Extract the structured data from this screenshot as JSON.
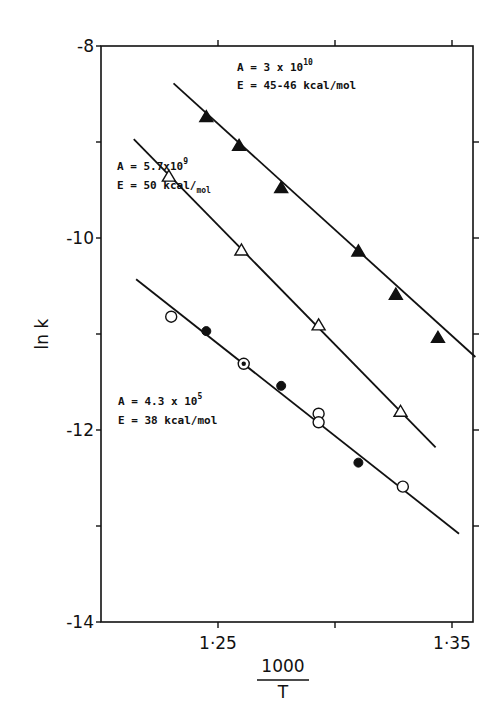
{
  "chart_data": {
    "type": "scatter",
    "title": "",
    "xlabel": "1000/T",
    "xlabel_numerator": "1000",
    "xlabel_denominator": "T",
    "ylabel": "ln k",
    "xlim": [
      1.2,
      1.359
    ],
    "ylim": [
      -14,
      -8
    ],
    "x_ticks": [
      1.25,
      1.3,
      1.35
    ],
    "x_tick_labels": [
      "1·25",
      "",
      "1·35"
    ],
    "y_ticks": [
      -8,
      -9,
      -10,
      -11,
      -12,
      -13,
      -14
    ],
    "y_tick_labels": [
      "-8",
      "",
      "-10",
      "",
      "-12",
      "",
      "-14"
    ],
    "grid": false,
    "legend": "none (inline annotations)",
    "series": [
      {
        "name": "filled triangles",
        "marker": "filled-triangle",
        "points": [
          [
            1.245,
            -8.74
          ],
          [
            1.259,
            -9.04
          ],
          [
            1.277,
            -9.48
          ],
          [
            1.31,
            -10.14
          ],
          [
            1.326,
            -10.59
          ],
          [
            1.344,
            -11.04
          ]
        ],
        "fit_line": [
          [
            1.231,
            -8.39
          ],
          [
            1.36,
            -11.24
          ]
        ],
        "annotation": {
          "A": "A = 3 x 10",
          "A_exp": "10",
          "E": "E = 45-46 kcal/mol"
        }
      },
      {
        "name": "open triangles",
        "marker": "open-triangle",
        "points": [
          [
            1.229,
            -9.36
          ],
          [
            1.26,
            -10.13
          ],
          [
            1.293,
            -10.91
          ],
          [
            1.328,
            -11.81
          ]
        ],
        "fit_line": [
          [
            1.214,
            -8.97
          ],
          [
            1.343,
            -12.18
          ]
        ],
        "annotation": {
          "A": "A = 5.7x10",
          "A_exp": "9",
          "E": "E = 50 kcal/",
          "E_sub": "mol"
        }
      },
      {
        "name": "circles",
        "marker": "open-circle",
        "points": [
          [
            1.23,
            -10.82
          ],
          [
            1.293,
            -11.83
          ],
          [
            1.293,
            -11.92
          ],
          [
            1.329,
            -12.59
          ]
        ],
        "fit_line": [
          [
            1.215,
            -10.43
          ],
          [
            1.353,
            -13.08
          ]
        ],
        "annotation": {
          "A": "A = 4.3 x 10",
          "A_exp": "5",
          "E": "E = 38 kcal/mol"
        }
      },
      {
        "name": "filled circles",
        "marker": "filled-circle",
        "points": [
          [
            1.245,
            -10.97
          ],
          [
            1.277,
            -11.54
          ],
          [
            1.31,
            -12.34
          ]
        ]
      },
      {
        "name": "dotted circle",
        "marker": "dotted-circle",
        "points": [
          [
            1.261,
            -11.31
          ]
        ]
      }
    ]
  },
  "plot": {
    "left": 101,
    "right": 473,
    "top": 46,
    "bottom": 622,
    "ink_color": "#111111",
    "background": "#ffffff"
  }
}
